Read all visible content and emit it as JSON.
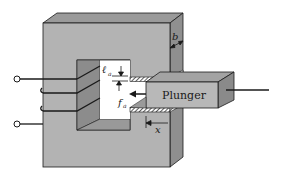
{
  "diagram": {
    "type": "electromechanical-actuator",
    "labels": {
      "plunger": "Plunger",
      "depth": "b",
      "gap_length": "ℓ",
      "gap_length_sub": "a",
      "force": "f",
      "force_sub": "a",
      "displacement": "x"
    },
    "colors": {
      "core_front": "#b3b3b3",
      "core_top": "#9a9a9a",
      "core_side": "#8f8f8f",
      "window": "#ffffff",
      "window_inner_left": "#8c8c8c",
      "window_inner_bottom": "#999999",
      "plunger_front": "#b8b8b8",
      "plunger_top": "#a3a3a3",
      "plunger_side": "#8a8a8a",
      "line": "#1a1a1a"
    },
    "coil_turns": 3,
    "terminals": 2
  }
}
